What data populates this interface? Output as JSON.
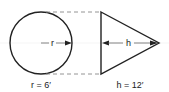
{
  "diagram": {
    "circle": {
      "radius_label": "r",
      "caption": "r = 6′"
    },
    "triangle": {
      "height_label": "h",
      "caption": "h = 12′"
    },
    "colors": {
      "stroke": "#222222",
      "dash": "#888888",
      "background": "#ffffff"
    }
  }
}
